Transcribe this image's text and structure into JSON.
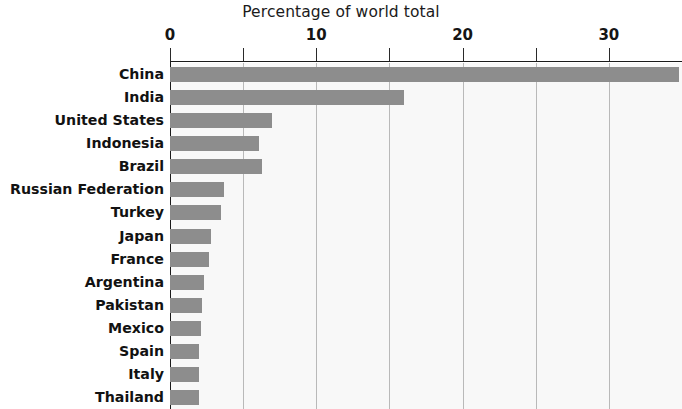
{
  "chart_data": {
    "type": "bar",
    "orientation": "horizontal",
    "title": "Percentage of world total",
    "xlabel": "",
    "ylabel": "",
    "xlim": [
      0,
      35
    ],
    "grid": true,
    "legend": false,
    "axis_position": "top",
    "xticks": [
      0,
      5,
      10,
      15,
      20,
      25,
      30,
      35
    ],
    "xtick_labels": [
      "0",
      "",
      "10",
      "",
      "20",
      "",
      "30",
      ""
    ],
    "categories": [
      "China",
      "India",
      "United States",
      "Indonesia",
      "Brazil",
      "Russian Federation",
      "Turkey",
      "Japan",
      "France",
      "Argentina",
      "Pakistan",
      "Mexico",
      "Spain",
      "Italy",
      "Thailand"
    ],
    "values": [
      34.8,
      16.0,
      7.0,
      6.1,
      6.3,
      3.7,
      3.5,
      2.8,
      2.7,
      2.3,
      2.2,
      2.1,
      2.0,
      2.0,
      2.0
    ],
    "bar_color": "#8d8d8d",
    "plot_background": "#f8f8f8",
    "gridline_color": "#b9b9b9",
    "axis_color": "#1a1a1a",
    "text_color": "#121212"
  }
}
